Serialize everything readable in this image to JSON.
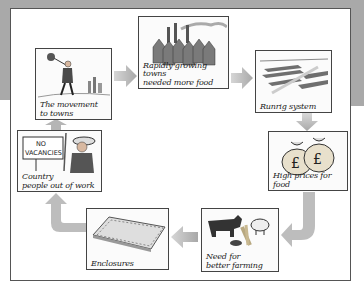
{
  "diagram": {
    "type": "cycle",
    "colors": {
      "background_band": "#a9a9a9",
      "frame_border": "#555555",
      "arrow_fill": "#b8b8b8",
      "box_border": "#444444"
    },
    "nodes": [
      {
        "id": "movement",
        "label": "The movement to towns",
        "line1": "The movement",
        "line2": "to towns",
        "icon": "man-walking-icon"
      },
      {
        "id": "towns",
        "label": "Rapidly growing towns needed more food",
        "line1": "Rapidly growing towns",
        "line2": "needed more food",
        "icon": "factory-town-icon"
      },
      {
        "id": "runrig",
        "label": "Runrig system",
        "line1": "Runrig system",
        "icon": "field-strips-icon"
      },
      {
        "id": "prices",
        "label": "High prices for food",
        "line1": "High prices for food",
        "icon": "money-bags-icon"
      },
      {
        "id": "farming",
        "label": "Need for better farming",
        "line1": "Need for",
        "line2": "better farming",
        "icon": "livestock-icon"
      },
      {
        "id": "enclosures",
        "label": "Enclosures",
        "line1": "Enclosures",
        "icon": "enclosed-field-icon"
      },
      {
        "id": "country",
        "label": "Country people out of work",
        "line1": "Country",
        "line2": "people out of work",
        "sign_line1": "NO",
        "sign_line2": "VACANCIES",
        "icon": "no-vacancies-sign-icon"
      }
    ],
    "edges": [
      {
        "from": "movement",
        "to": "towns"
      },
      {
        "from": "towns",
        "to": "runrig"
      },
      {
        "from": "runrig",
        "to": "prices"
      },
      {
        "from": "prices",
        "to": "farming"
      },
      {
        "from": "farming",
        "to": "enclosures"
      },
      {
        "from": "enclosures",
        "to": "country"
      },
      {
        "from": "country",
        "to": "movement"
      }
    ]
  }
}
